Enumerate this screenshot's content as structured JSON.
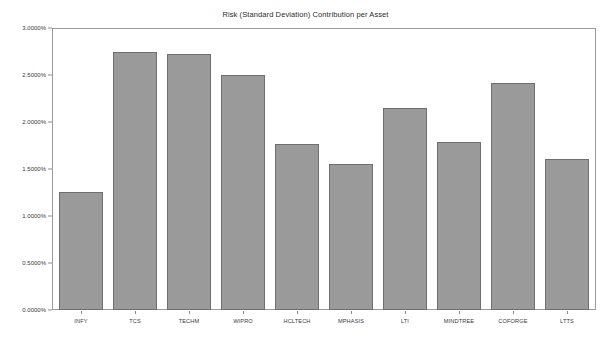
{
  "chart_data": {
    "type": "bar",
    "title": "Risk (Standard Deviation) Contribution per Asset",
    "xlabel": "",
    "ylabel": "",
    "categories": [
      "INFY",
      "TCS",
      "TECHM",
      "WIPRO",
      "HCLTECH",
      "MPHASIS",
      "LTI",
      "MINDTREE",
      "COFORGE",
      "LTTS"
    ],
    "values": [
      1.26,
      2.74,
      2.72,
      2.5,
      1.77,
      1.55,
      2.15,
      1.79,
      2.41,
      1.61
    ],
    "value_labels": [
      "1.2600%",
      "2.7400%",
      "2.7200%",
      "2.5000%",
      "1.7700%",
      "1.5500%",
      "2.1500%",
      "1.7900%",
      "2.4100%",
      "1.6100%"
    ],
    "ylim": [
      0,
      3.0
    ],
    "ytick_values": [
      0.0,
      0.5,
      1.0,
      1.5,
      2.0,
      2.5,
      3.0
    ],
    "ytick_labels": [
      "0.0000%",
      "0.5000%",
      "1.0000%",
      "1.5000%",
      "2.0000%",
      "2.5000%",
      "3.0000%"
    ],
    "grid": false,
    "legend": null,
    "bar_color": "#9a9a9a",
    "bar_edge_color": "#6f6f6f",
    "background_color": "#ffffff",
    "axis_color": "#9a9a9a"
  }
}
